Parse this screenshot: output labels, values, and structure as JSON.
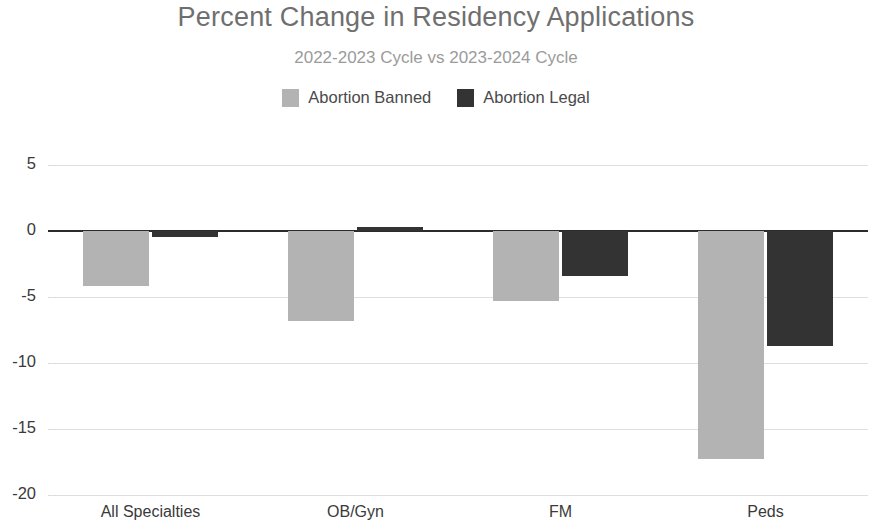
{
  "chart_data": {
    "type": "bar",
    "title": "Percent Change in Residency Applications",
    "subtitle": "2022-2023 Cycle vs 2023-2024 Cycle",
    "xlabel": "",
    "ylabel": "",
    "categories": [
      "All Specialties",
      "OB/Gyn",
      "FM",
      "Peds"
    ],
    "series": [
      {
        "name": "Abortion Banned",
        "color": "#b3b3b3",
        "values": [
          -4.2,
          -6.8,
          -5.3,
          -17.3
        ]
      },
      {
        "name": "Abortion Legal",
        "color": "#333333",
        "values": [
          -0.5,
          0.3,
          -3.4,
          -8.7
        ]
      }
    ],
    "ylim": [
      -20,
      6.5
    ],
    "yticks": [
      5,
      0,
      -5,
      -10,
      -15,
      -20
    ],
    "ytick_labels": [
      "5",
      "0",
      "-5",
      "-10",
      "-15",
      "-20"
    ],
    "grid": true,
    "legend_position": "top-center",
    "zero_line": 0
  },
  "colors": {
    "banned": "#b3b3b3",
    "legal": "#333333",
    "title": "#6f6f6f",
    "subtitle": "#9b9b9b",
    "grid": "#e0e0e0",
    "axis": "#2b2b2b",
    "background": "#ffffff"
  }
}
